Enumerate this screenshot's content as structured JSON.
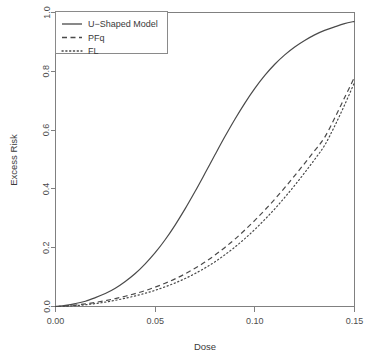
{
  "chart_data": {
    "type": "line",
    "title": "",
    "xlabel": "Dose",
    "ylabel": "Excess Risk",
    "xlim": [
      0.0,
      0.15
    ],
    "ylim": [
      0.0,
      1.0
    ],
    "xticks": [
      "0.00",
      "0.05",
      "0.10",
      "0.15"
    ],
    "xtick_values": [
      0.0,
      0.05,
      0.1,
      0.15
    ],
    "yticks": [
      "0.0",
      "0.2",
      "0.4",
      "0.6",
      "0.8",
      "1.0"
    ],
    "ytick_values": [
      0.0,
      0.2,
      0.4,
      0.6,
      0.8,
      1.0
    ],
    "grid": false,
    "legend_position": "top-left",
    "x": [
      0.0,
      0.005,
      0.01,
      0.015,
      0.02,
      0.025,
      0.03,
      0.035,
      0.04,
      0.045,
      0.05,
      0.055,
      0.06,
      0.065,
      0.07,
      0.075,
      0.08,
      0.085,
      0.09,
      0.095,
      0.1,
      0.105,
      0.11,
      0.115,
      0.12,
      0.125,
      0.13,
      0.135,
      0.14,
      0.145,
      0.15
    ],
    "series": [
      {
        "name": "U-Shaped Model",
        "style": "solid",
        "values": [
          0.0,
          0.004,
          0.01,
          0.018,
          0.03,
          0.044,
          0.062,
          0.085,
          0.112,
          0.145,
          0.183,
          0.227,
          0.277,
          0.332,
          0.391,
          0.453,
          0.516,
          0.578,
          0.637,
          0.692,
          0.742,
          0.786,
          0.824,
          0.856,
          0.883,
          0.905,
          0.924,
          0.939,
          0.951,
          0.962,
          0.97
        ]
      },
      {
        "name": "PFq",
        "style": "dashed",
        "values": [
          0.0,
          0.002,
          0.005,
          0.009,
          0.014,
          0.02,
          0.027,
          0.035,
          0.044,
          0.054,
          0.066,
          0.079,
          0.094,
          0.111,
          0.13,
          0.151,
          0.175,
          0.201,
          0.229,
          0.26,
          0.293,
          0.328,
          0.365,
          0.404,
          0.445,
          0.487,
          0.53,
          0.575,
          0.64,
          0.71,
          0.78
        ]
      },
      {
        "name": "FL",
        "style": "dotted",
        "values": [
          0.0,
          0.001,
          0.003,
          0.006,
          0.01,
          0.015,
          0.021,
          0.028,
          0.036,
          0.045,
          0.055,
          0.067,
          0.08,
          0.095,
          0.112,
          0.131,
          0.152,
          0.176,
          0.202,
          0.231,
          0.262,
          0.296,
          0.332,
          0.371,
          0.412,
          0.455,
          0.5,
          0.548,
          0.613,
          0.685,
          0.762
        ]
      }
    ]
  },
  "axes": {
    "xlabel": "Dose",
    "ylabel": "Excess Risk"
  },
  "legend": {
    "entries": [
      {
        "label": "U−Shaped Model",
        "style": "solid"
      },
      {
        "label": "PFq",
        "style": "dashed"
      },
      {
        "label": "FL",
        "style": "dotted"
      }
    ]
  }
}
